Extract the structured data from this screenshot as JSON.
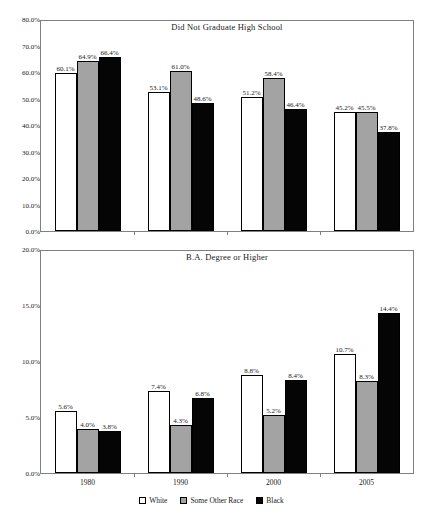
{
  "chart_data": [
    {
      "type": "bar",
      "title": "Did Not Graduate High School",
      "xlabel": "",
      "ylabel": "",
      "categories": [
        "1980",
        "1990",
        "2000",
        "2005"
      ],
      "ylim": [
        0,
        80
      ],
      "yticks": [
        "0.0%",
        "10.0%",
        "20.0%",
        "30.0%",
        "40.0%",
        "50.0%",
        "60.0%",
        "70.0%",
        "80.0%"
      ],
      "ytick_values": [
        0,
        10,
        20,
        30,
        40,
        50,
        60,
        70,
        80
      ],
      "grid": false,
      "legend_position": "bottom",
      "series": [
        {
          "name": "White",
          "color": "#ffffff",
          "values": [
            60.1,
            53.1,
            51.2,
            45.2
          ],
          "labels": [
            "60.1%",
            "53.1%",
            "51.2%",
            "45.2%"
          ]
        },
        {
          "name": "Some Other Race",
          "color": "#a3a3a3",
          "values": [
            64.9,
            61.0,
            58.4,
            45.5
          ],
          "labels": [
            "64.9%",
            "61.0%",
            "58.4%",
            "45.5%"
          ]
        },
        {
          "name": "Black",
          "color": "#050505",
          "values": [
            66.4,
            48.6,
            46.4,
            37.8
          ],
          "labels": [
            "66.4%",
            "48.6%",
            "46.4%",
            "37.8%"
          ]
        }
      ]
    },
    {
      "type": "bar",
      "title": "B.A. Degree or Higher",
      "xlabel": "",
      "ylabel": "",
      "categories": [
        "1980",
        "1990",
        "2000",
        "2005"
      ],
      "ylim": [
        0,
        20
      ],
      "yticks": [
        "0.0%",
        "5.0%",
        "10.0%",
        "15.0%",
        "20.0%"
      ],
      "ytick_values": [
        0,
        5,
        10,
        15,
        20
      ],
      "grid": false,
      "legend_position": "bottom",
      "series": [
        {
          "name": "White",
          "color": "#ffffff",
          "values": [
            5.6,
            7.4,
            8.8,
            10.7
          ],
          "labels": [
            "5.6%",
            "7.4%",
            "8.8%",
            "10.7%"
          ]
        },
        {
          "name": "Some Other Race",
          "color": "#a3a3a3",
          "values": [
            4.0,
            4.3,
            5.2,
            8.3
          ],
          "labels": [
            "4.0%",
            "4.3%",
            "5.2%",
            "8.3%"
          ]
        },
        {
          "name": "Black",
          "color": "#050505",
          "values": [
            3.8,
            6.8,
            8.4,
            14.4
          ],
          "labels": [
            "3.8%",
            "6.8%",
            "8.4%",
            "14.4%"
          ]
        }
      ]
    }
  ],
  "legend": {
    "items": [
      {
        "label": "White",
        "swatch": "white"
      },
      {
        "label": "Some Other Race",
        "swatch": "gray"
      },
      {
        "label": "Black",
        "swatch": "black"
      }
    ]
  }
}
